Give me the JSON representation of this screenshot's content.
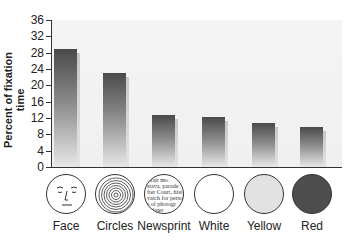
{
  "chart_data": {
    "type": "bar",
    "title": "",
    "xlabel": "",
    "ylabel": "Percent of fixation time",
    "ylim": [
      0,
      36
    ],
    "yticks": [
      0,
      4,
      8,
      12,
      16,
      20,
      24,
      28,
      32,
      36
    ],
    "grid": false,
    "legend": null,
    "categories": [
      "Face",
      "Circles",
      "Newsprint",
      "White",
      "Yellow",
      "Red"
    ],
    "values": [
      29,
      23,
      12.7,
      12.2,
      10.8,
      9.8
    ],
    "stimulus_icons": [
      "face-drawing",
      "concentric-circles",
      "newsprint-text",
      "white-disc",
      "yellow-disc",
      "red-disc"
    ],
    "stimulus_fills": [
      "#ffffff",
      "#ffffff",
      "#ffffff",
      "#ffffff",
      "#e2e2e2",
      "#4d4d4d"
    ]
  },
  "axis": {
    "y_title": "Percent of fixation time",
    "y_tick_labels": [
      "0",
      "4",
      "8",
      "12",
      "16",
      "20",
      "24",
      "28",
      "32",
      "36"
    ]
  },
  "stimuli": [
    {
      "label": "Face"
    },
    {
      "label": "Circles"
    },
    {
      "label": "Newsprint"
    },
    {
      "label": "White"
    },
    {
      "label": "Yellow"
    },
    {
      "label": "Red"
    }
  ],
  "newsprint_lines": [
    "rtrait mo",
    "stava, parade",
    "fter Court, hist",
    "vatch for perso",
    "s of photogr",
    "le later"
  ]
}
